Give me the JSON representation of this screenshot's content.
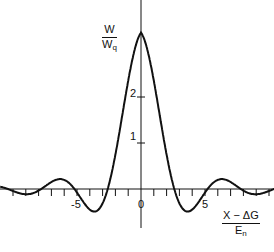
{
  "chart_data": {
    "type": "line",
    "title": "",
    "xlabel": {
      "numerator": "X − ΔG",
      "denominator": "E",
      "denominator_sub": "n"
    },
    "ylabel": {
      "numerator": "W",
      "denominator": "W",
      "denominator_sub": "q"
    },
    "x_ticks": [
      -10,
      -9,
      -8,
      -7,
      -6,
      -5,
      -4,
      -3,
      -2,
      -1,
      0,
      1,
      2,
      3,
      4,
      5,
      6,
      7,
      8,
      9,
      10
    ],
    "x_tick_labels": [
      {
        "value": -5,
        "label": "-5"
      },
      {
        "value": 0,
        "label": "0"
      },
      {
        "value": 5,
        "label": "5"
      }
    ],
    "y_tick_labels": [
      {
        "value": 1,
        "label": "1"
      },
      {
        "value": 2,
        "label": "2"
      }
    ],
    "xlim": [
      -11,
      10.5
    ],
    "ylim": [
      -0.6,
      4
    ],
    "grid": false,
    "legend": null,
    "series": [
      {
        "name": "W/Wq",
        "x": [
          -10,
          -9,
          -8,
          -7,
          -6,
          -5,
          -4.5,
          -4,
          -3.5,
          -3,
          -2.5,
          -2,
          -1.5,
          -1,
          -0.5,
          0,
          0.5,
          1,
          1.5,
          2,
          2.5,
          3,
          3.5,
          4,
          4.5,
          5,
          6,
          7,
          8,
          9,
          10
        ],
        "values": [
          0,
          0,
          0,
          0,
          0.02,
          0.1,
          0.08,
          0,
          -0.2,
          -0.38,
          -0.2,
          0.3,
          1.1,
          2.1,
          3.0,
          3.4,
          3.0,
          2.1,
          1.1,
          0.3,
          -0.2,
          -0.38,
          -0.2,
          0,
          0.08,
          0.1,
          0.02,
          0,
          0,
          0,
          0
        ]
      }
    ]
  }
}
